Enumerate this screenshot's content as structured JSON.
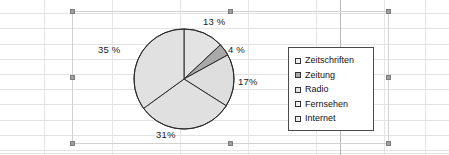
{
  "app": {
    "context": "spreadsheet-with-selected-chart-object"
  },
  "chart_data": {
    "type": "pie",
    "title": "",
    "categories": [
      "Zeitschriften",
      "Zeitung",
      "Radio",
      "Fernsehen",
      "Internet"
    ],
    "values": [
      13,
      4,
      17,
      31,
      35
    ],
    "labels": [
      "13 %",
      "4 %",
      "17%",
      "31%",
      "35 %"
    ],
    "unit": "%",
    "start_angle_deg": 0,
    "direction": "clockwise",
    "legend_position": "right",
    "grid": false,
    "slice_colors": [
      "#e3e3e3",
      "#a9a9a9",
      "#dedede",
      "#e0e0e0",
      "#e1e1e1"
    ],
    "slice_border_color": "#2b2b2b"
  },
  "legend": {
    "items": [
      {
        "label": "Zeitschriften",
        "swatch": "#eeeeee"
      },
      {
        "label": "Zeitung",
        "swatch": "#a9a9a9"
      },
      {
        "label": "Radio",
        "swatch": "#e6e6e6"
      },
      {
        "label": "Fernsehen",
        "swatch": "#f0f0f0"
      },
      {
        "label": "Internet",
        "swatch": "#ededed"
      }
    ]
  },
  "selection": {
    "handle_color": "#9e9e9e",
    "frame_color": "#d2d2d2"
  }
}
